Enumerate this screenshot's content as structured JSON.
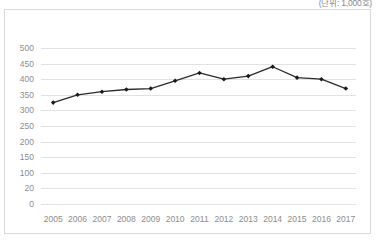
{
  "unit_note": "(단위: 1,000호)",
  "chart_data": {
    "type": "line",
    "title": "",
    "subtitle": "",
    "xlabel": "",
    "ylabel": "",
    "unit_note": "(단위: 1,000호)",
    "categories": [
      "2005",
      "2006",
      "2007",
      "2008",
      "2009",
      "2010",
      "2011",
      "2012",
      "2013",
      "2014",
      "2015",
      "2016",
      "2017"
    ],
    "values": [
      325,
      350,
      360,
      367,
      370,
      395,
      420,
      400,
      410,
      440,
      405,
      400,
      370
    ],
    "series": [
      {
        "name": "",
        "values": [
          325,
          350,
          360,
          367,
          370,
          395,
          420,
          400,
          410,
          440,
          405,
          400,
          370
        ]
      }
    ],
    "ylim": [
      0,
      500
    ],
    "yticks": [
      500,
      450,
      400,
      350,
      300,
      250,
      200,
      150,
      100,
      20,
      0
    ],
    "ytick_labels": [
      "500",
      "450",
      "400",
      "350",
      "300",
      "250",
      "200",
      "150",
      "100",
      "20",
      "0"
    ],
    "grid": true,
    "grid_axis": "y",
    "legend": false,
    "legend_position": "none",
    "marker": "diamond",
    "line_color": "#2b2b2b",
    "marker_color": "#1a1a1a",
    "grid_color": "#e2e2e2",
    "axis_text_color": "#8d8d8d",
    "border_color": "#d9d9d9",
    "background_color": "#ffffff"
  }
}
